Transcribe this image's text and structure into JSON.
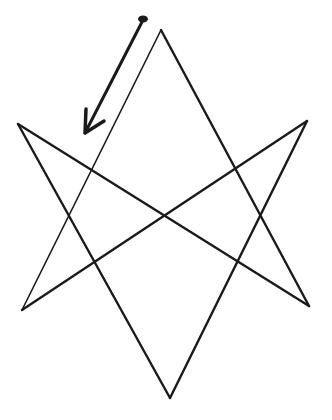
{
  "diagram": {
    "stroke_color": "#1a1a1a",
    "background": "#ffffff",
    "points": {
      "top": [
        161,
        30
      ],
      "upper_left": [
        18,
        124
      ],
      "upper_right": [
        307,
        121
      ],
      "lower_left": [
        22,
        310
      ],
      "lower_right": [
        309,
        306
      ],
      "bottom": [
        170,
        398
      ]
    },
    "edges": [
      [
        "top",
        "lower_left"
      ],
      [
        "lower_left",
        "upper_right"
      ],
      [
        "upper_right",
        "bottom"
      ],
      [
        "bottom",
        "upper_left"
      ],
      [
        "upper_left",
        "lower_right"
      ],
      [
        "lower_right",
        "top"
      ]
    ],
    "arrow": {
      "from": [
        143,
        20
      ],
      "to": [
        85,
        133
      ],
      "direction": "down-left"
    }
  }
}
